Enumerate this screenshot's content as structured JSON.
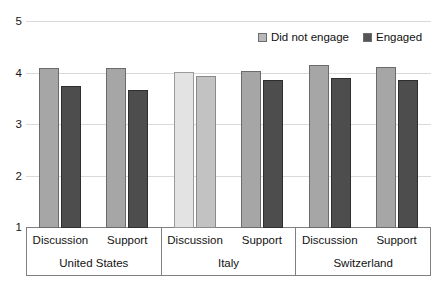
{
  "chart_data": {
    "type": "bar",
    "title": "",
    "xlabel": "",
    "ylabel": "",
    "ylim": [
      1,
      5
    ],
    "yticks": [
      "1",
      "2",
      "3",
      "4",
      "5"
    ],
    "grid": true,
    "legend_position": "top-right",
    "groups": [
      "United States",
      "Italy",
      "Switzerland"
    ],
    "categories": [
      "Discussion",
      "Support",
      "Discussion",
      "Support",
      "Discussion",
      "Support"
    ],
    "series": [
      {
        "name": "Did not engage",
        "color": "#a6a6a6",
        "values": [
          4.1,
          4.1,
          4.03,
          4.05,
          4.17,
          4.12
        ]
      },
      {
        "name": "Engaged",
        "color": "#4d4d4d",
        "values": [
          3.75,
          3.68,
          3.95,
          3.87,
          3.91,
          3.88
        ]
      }
    ]
  },
  "axis": {
    "ticks": [
      {
        "label": "5",
        "value": 5
      },
      {
        "label": "4",
        "value": 4
      },
      {
        "label": "3",
        "value": 3
      },
      {
        "label": "2",
        "value": 2
      },
      {
        "label": "1",
        "value": 1
      }
    ]
  },
  "legend": {
    "items": [
      {
        "label": "Did not engage",
        "swatch": "light-gray-square"
      },
      {
        "label": "Engaged",
        "swatch": "dark-gray-square"
      }
    ]
  },
  "categories_table": {
    "subcategories": [
      "Discussion",
      "Support",
      "Discussion",
      "Support",
      "Discussion",
      "Support"
    ],
    "groups": [
      "United States",
      "Italy",
      "Switzerland"
    ]
  },
  "bars": [
    {
      "group": "United States",
      "sub": "Discussion",
      "series": "Did not engage",
      "value": 4.1,
      "style": "light"
    },
    {
      "group": "United States",
      "sub": "Discussion",
      "series": "Engaged",
      "value": 3.75,
      "style": "dark"
    },
    {
      "group": "United States",
      "sub": "Support",
      "series": "Did not engage",
      "value": 4.1,
      "style": "light"
    },
    {
      "group": "United States",
      "sub": "Support",
      "series": "Engaged",
      "value": 3.68,
      "style": "dark"
    },
    {
      "group": "Italy",
      "sub": "Discussion",
      "series": "Did not engage",
      "value": 4.03,
      "style": "faded-light"
    },
    {
      "group": "Italy",
      "sub": "Discussion",
      "series": "Engaged",
      "value": 3.95,
      "style": "faded-mid"
    },
    {
      "group": "Italy",
      "sub": "Support",
      "series": "Did not engage",
      "value": 4.05,
      "style": "light"
    },
    {
      "group": "Italy",
      "sub": "Support",
      "series": "Engaged",
      "value": 3.87,
      "style": "dark"
    },
    {
      "group": "Switzerland",
      "sub": "Discussion",
      "series": "Did not engage",
      "value": 4.17,
      "style": "light"
    },
    {
      "group": "Switzerland",
      "sub": "Discussion",
      "series": "Engaged",
      "value": 3.91,
      "style": "dark"
    },
    {
      "group": "Switzerland",
      "sub": "Support",
      "series": "Did not engage",
      "value": 4.12,
      "style": "light"
    },
    {
      "group": "Switzerland",
      "sub": "Support",
      "series": "Engaged",
      "value": 3.88,
      "style": "dark"
    }
  ]
}
